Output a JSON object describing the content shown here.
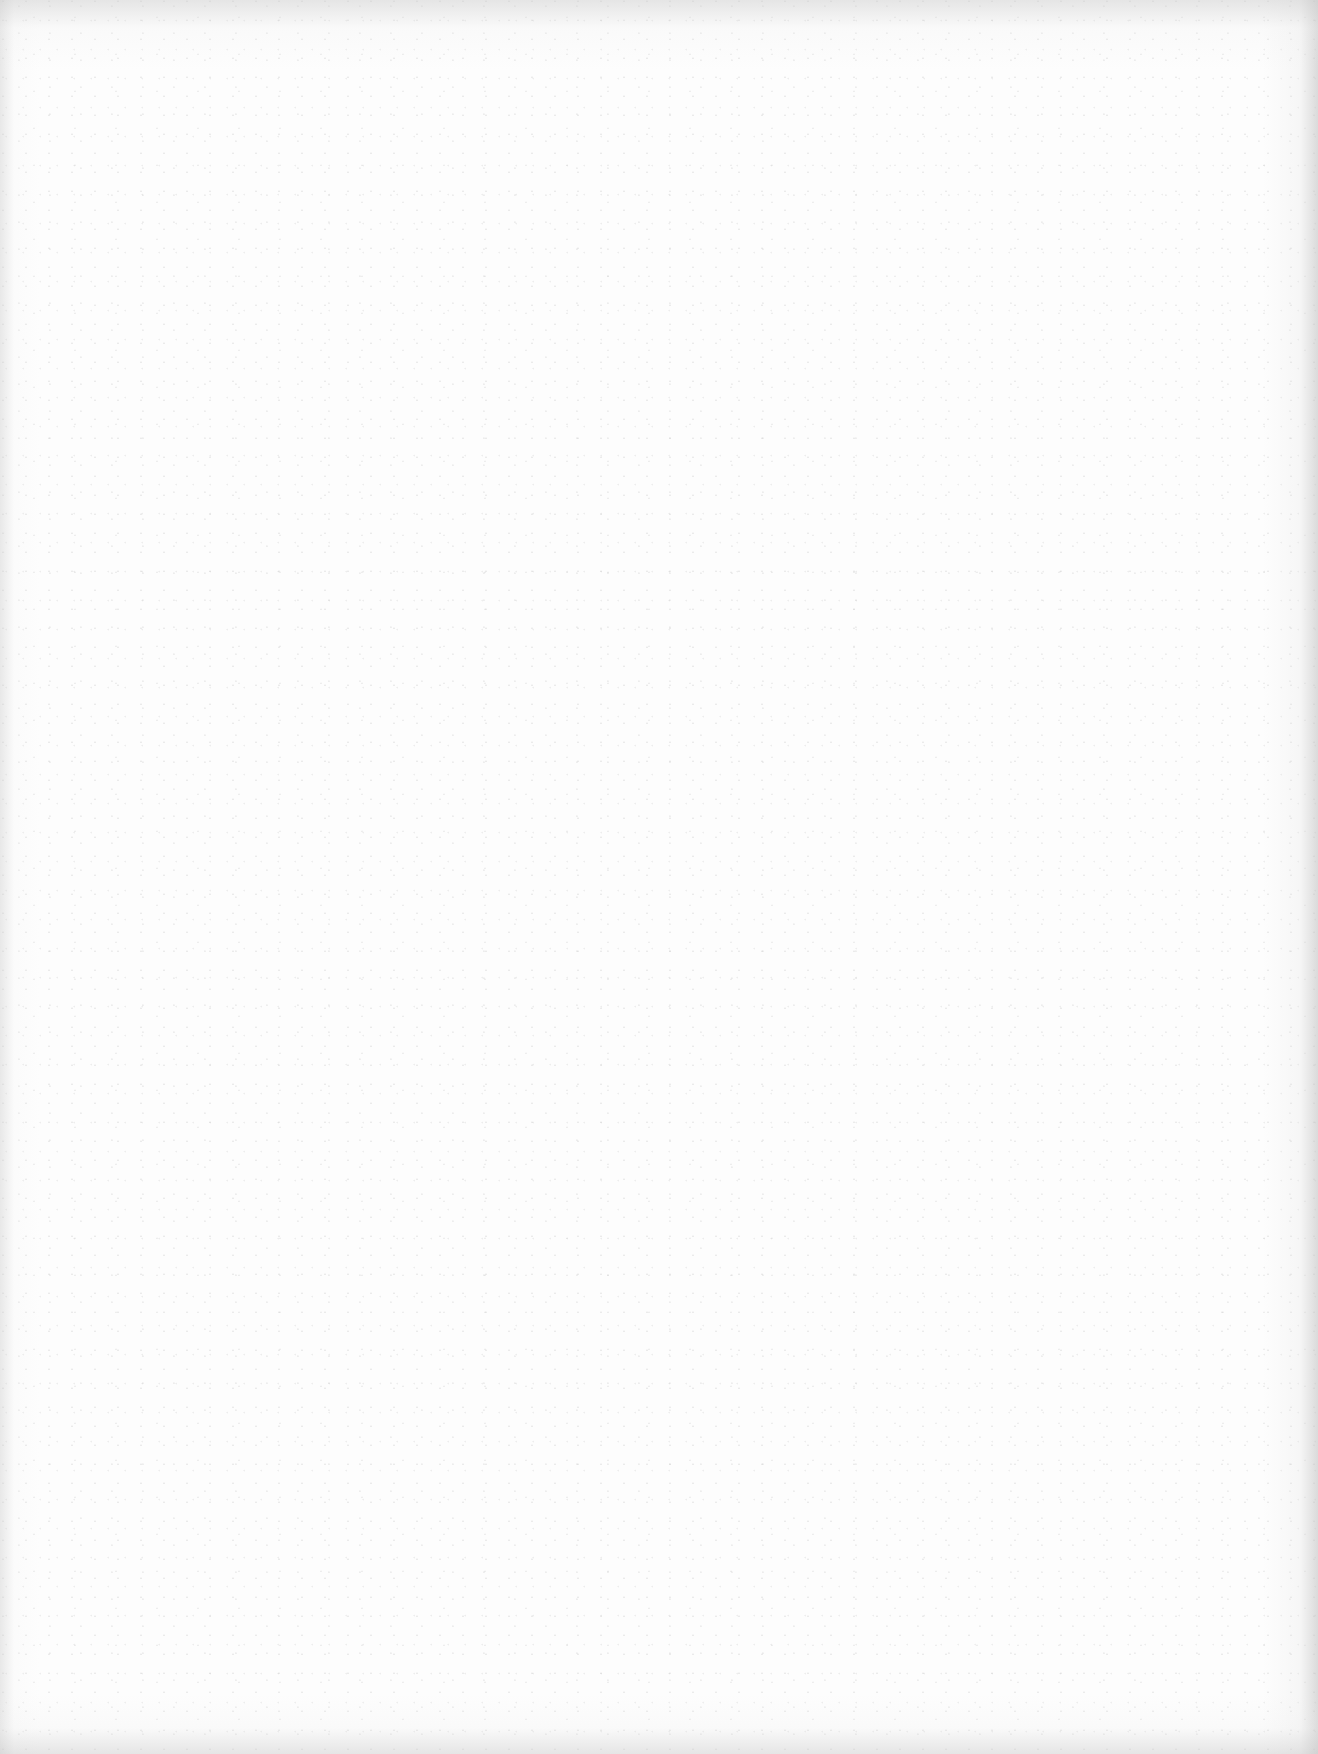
{
  "document": {
    "type": "blank-scanned-page",
    "text": "",
    "background_color": "#fdfdfd",
    "edge_shadow_color": "#c8c8c8"
  }
}
